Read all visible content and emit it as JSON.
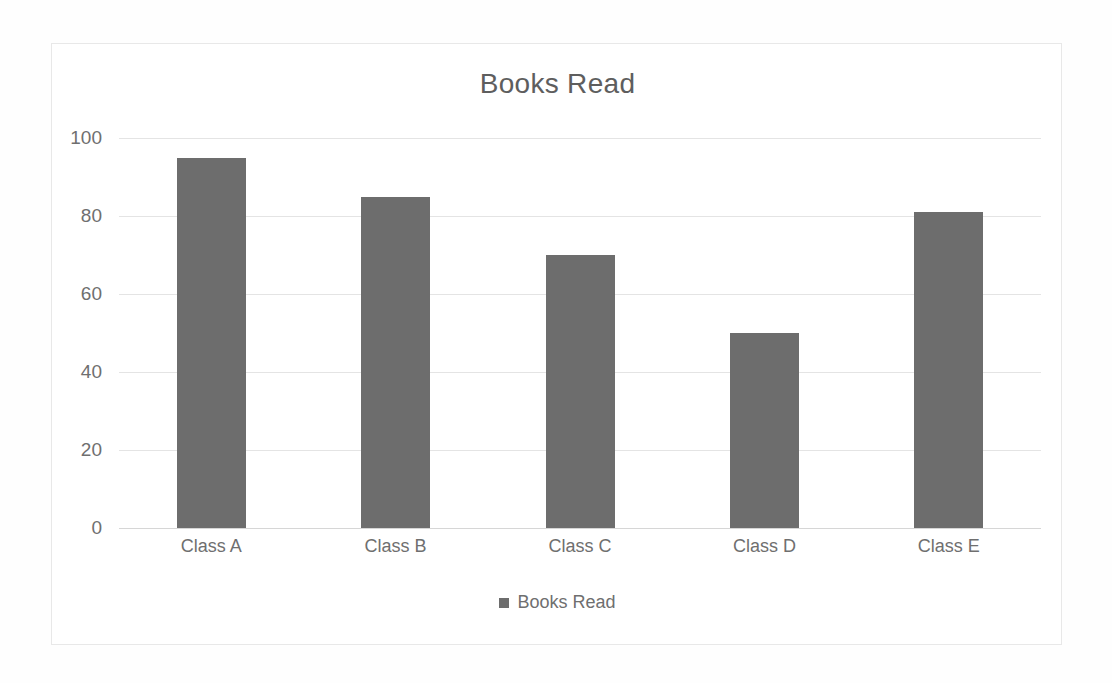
{
  "chart_data": {
    "type": "bar",
    "title": "Books Read",
    "categories": [
      "Class A",
      "Class B",
      "Class C",
      "Class D",
      "Class E"
    ],
    "values": [
      95,
      85,
      70,
      50,
      81
    ],
    "series": [
      {
        "name": "Books Read",
        "values": [
          95,
          85,
          70,
          50,
          81
        ]
      }
    ],
    "xlabel": "",
    "ylabel": "",
    "ylim": [
      0,
      100
    ],
    "yticks": [
      0,
      20,
      40,
      60,
      80,
      100
    ],
    "ytick_labels": [
      "0",
      "20",
      "40",
      "60",
      "80",
      "100"
    ],
    "grid": true,
    "grid_axis": "y",
    "legend": {
      "position": "bottom",
      "entries": [
        {
          "label": "Books Read",
          "color": "#6d6d6d",
          "marker": "square"
        }
      ]
    },
    "colors": {
      "bar": "#6d6d6d",
      "title_text": "#5e5e5e",
      "tick_text": "#6f6f6f",
      "gridline": "#e4e4e4",
      "axis_line": "#d6d6d6",
      "plot_background": "#ffffff",
      "frame_border": "#e8e8e8"
    }
  }
}
